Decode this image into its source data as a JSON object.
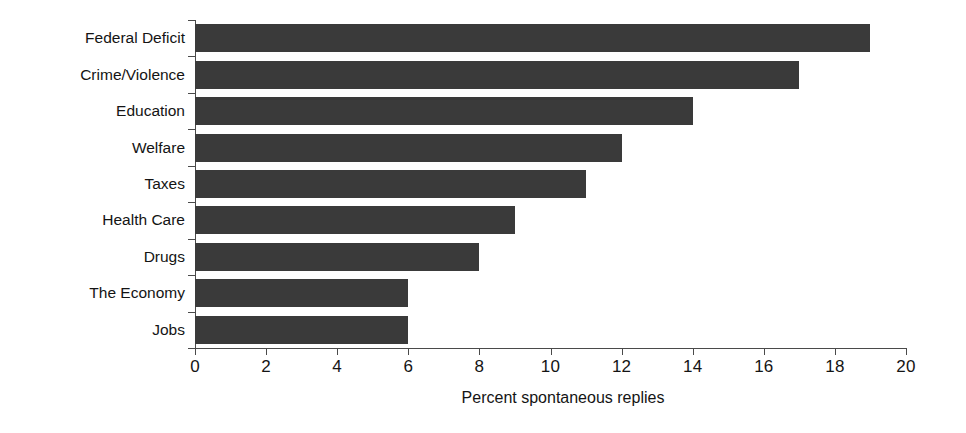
{
  "chart_data": {
    "type": "bar",
    "orientation": "horizontal",
    "title": "",
    "xlabel": "Percent spontaneous replies",
    "ylabel": "",
    "xlim": [
      0,
      20
    ],
    "xticks": [
      0,
      2,
      4,
      6,
      8,
      10,
      12,
      14,
      16,
      18,
      20
    ],
    "xtick_labels": [
      "0",
      "2",
      "4",
      "6",
      "8",
      "10",
      "12",
      "14",
      "16",
      "18",
      "20"
    ],
    "grid": false,
    "legend": false,
    "bar_color": "#3a3a3a",
    "background_color": "#ffffff",
    "axis_color": "#4a4a4a",
    "categories": [
      "Federal Deficit",
      "Crime/Violence",
      "Education",
      "Welfare",
      "Taxes",
      "Health Care",
      "Drugs",
      "The Economy",
      "Jobs"
    ],
    "values": [
      19,
      17,
      14,
      12,
      11,
      9,
      8,
      6,
      6
    ]
  }
}
